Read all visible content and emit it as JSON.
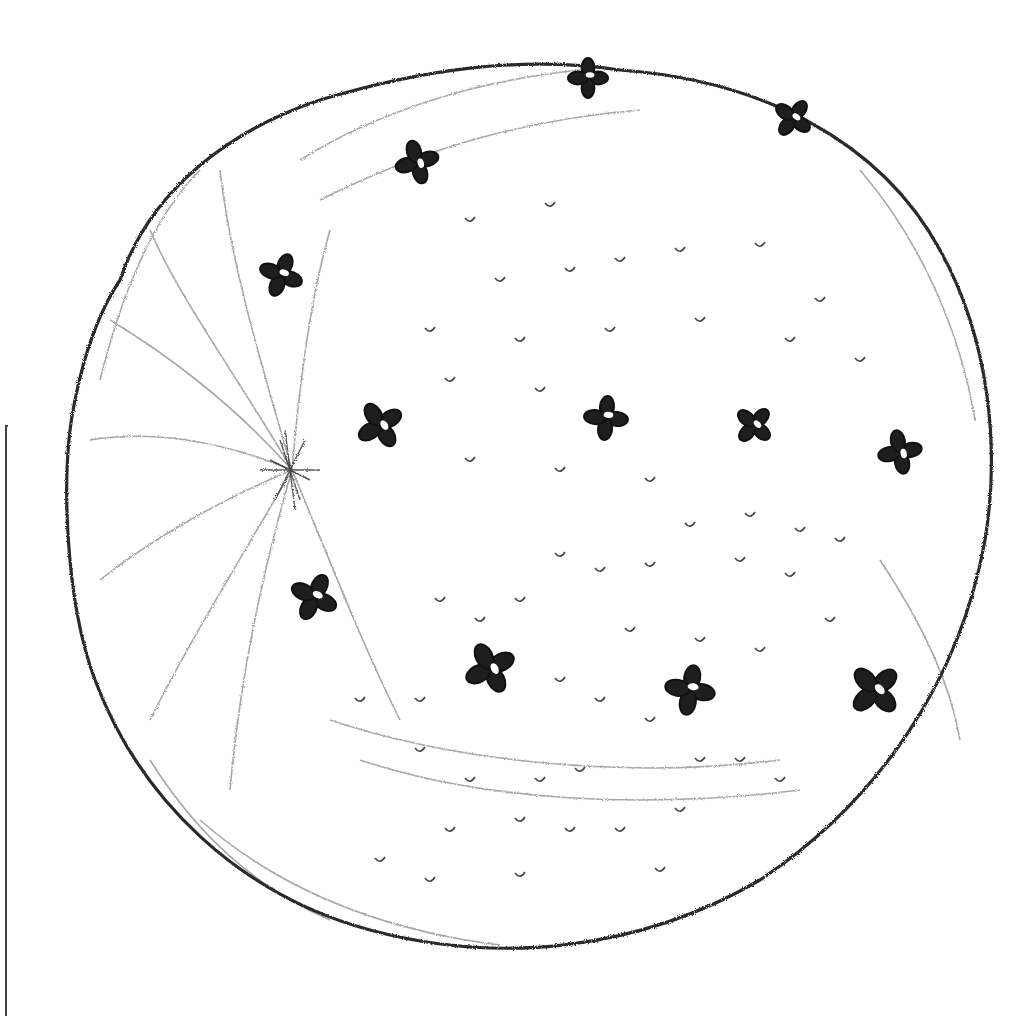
{
  "image": {
    "subject": "pencil sketch of an orange studded with cloves",
    "style": "graphite pencil drawing, monochrome",
    "background": "#ffffff",
    "ink_color": "#2a2a2a",
    "shade_color": "#8a8a8a"
  },
  "fruit": {
    "outline": {
      "cx": 530,
      "cy": 490,
      "rx": 462,
      "ry": 450
    },
    "navel": {
      "x": 292,
      "y": 470
    },
    "cloves": [
      {
        "x": 588,
        "y": 78,
        "r": 20
      },
      {
        "x": 793,
        "y": 118,
        "r": 20
      },
      {
        "x": 417,
        "y": 162,
        "r": 22
      },
      {
        "x": 281,
        "y": 275,
        "r": 22
      },
      {
        "x": 380,
        "y": 425,
        "r": 24
      },
      {
        "x": 606,
        "y": 418,
        "r": 22
      },
      {
        "x": 754,
        "y": 425,
        "r": 20
      },
      {
        "x": 900,
        "y": 452,
        "r": 22
      },
      {
        "x": 314,
        "y": 597,
        "r": 24
      },
      {
        "x": 490,
        "y": 668,
        "r": 26
      },
      {
        "x": 690,
        "y": 690,
        "r": 25
      },
      {
        "x": 875,
        "y": 690,
        "r": 27
      }
    ],
    "pores": [
      [
        470,
        220
      ],
      [
        550,
        205
      ],
      [
        620,
        260
      ],
      [
        680,
        250
      ],
      [
        760,
        245
      ],
      [
        820,
        300
      ],
      [
        500,
        280
      ],
      [
        570,
        270
      ],
      [
        430,
        330
      ],
      [
        520,
        340
      ],
      [
        610,
        330
      ],
      [
        700,
        320
      ],
      [
        790,
        340
      ],
      [
        860,
        360
      ],
      [
        450,
        380
      ],
      [
        540,
        390
      ],
      [
        470,
        460
      ],
      [
        560,
        470
      ],
      [
        650,
        480
      ],
      [
        690,
        525
      ],
      [
        750,
        515
      ],
      [
        800,
        530
      ],
      [
        840,
        540
      ],
      [
        560,
        555
      ],
      [
        600,
        570
      ],
      [
        650,
        565
      ],
      [
        740,
        560
      ],
      [
        790,
        575
      ],
      [
        830,
        620
      ],
      [
        440,
        600
      ],
      [
        480,
        620
      ],
      [
        520,
        600
      ],
      [
        630,
        630
      ],
      [
        700,
        640
      ],
      [
        760,
        650
      ],
      [
        420,
        700
      ],
      [
        560,
        680
      ],
      [
        600,
        700
      ],
      [
        650,
        720
      ],
      [
        360,
        700
      ],
      [
        420,
        750
      ],
      [
        470,
        780
      ],
      [
        540,
        780
      ],
      [
        580,
        770
      ],
      [
        700,
        760
      ],
      [
        740,
        760
      ],
      [
        780,
        780
      ],
      [
        450,
        830
      ],
      [
        520,
        820
      ],
      [
        570,
        830
      ],
      [
        620,
        830
      ],
      [
        380,
        860
      ],
      [
        430,
        880
      ],
      [
        520,
        875
      ],
      [
        680,
        810
      ],
      [
        660,
        870
      ]
    ]
  },
  "frame": {
    "left": 5,
    "top": 425,
    "side": "left partial border"
  }
}
